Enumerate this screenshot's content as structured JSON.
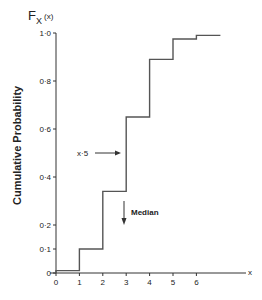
{
  "chart_data": {
    "type": "line",
    "subtype": "step",
    "title": "",
    "function_label": "F",
    "function_subscript": "X",
    "function_arg": "(x)",
    "xlabel": "x",
    "ylabel": "Cumulative Probability",
    "xlim": [
      0,
      7
    ],
    "ylim": [
      0,
      1.0
    ],
    "x_ticks": [
      "0",
      "1",
      "2",
      "3",
      "4",
      "5",
      "6"
    ],
    "y_ticks": [
      "0",
      "0·1",
      "0·2",
      "0·4",
      "0·6",
      "0·8",
      "1·0"
    ],
    "y_tick_values": [
      0,
      0.1,
      0.2,
      0.4,
      0.6,
      0.8,
      1.0
    ],
    "grid": false,
    "series": [
      {
        "name": "F_X(x)",
        "steps": [
          {
            "x_start": 0,
            "x_end": 1,
            "y": 0.01
          },
          {
            "x_start": 1,
            "x_end": 2,
            "y": 0.1
          },
          {
            "x_start": 2,
            "x_end": 3,
            "y": 0.34
          },
          {
            "x_start": 3,
            "x_end": 4,
            "y": 0.65
          },
          {
            "x_start": 4,
            "x_end": 5,
            "y": 0.89
          },
          {
            "x_start": 5,
            "x_end": 6,
            "y": 0.975
          },
          {
            "x_start": 6,
            "x_end": 7,
            "y": 0.99
          }
        ]
      }
    ],
    "annotations": [
      {
        "text": "x·5",
        "type": "arrow-right",
        "target_x": 3,
        "y": 0.5
      },
      {
        "text": "Median",
        "type": "arrow-down",
        "x": 3,
        "y": 0.24
      }
    ]
  }
}
